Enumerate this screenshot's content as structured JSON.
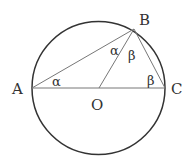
{
  "diagram": {
    "type": "geometry",
    "points": {
      "A": {
        "label": "A"
      },
      "B": {
        "label": "B"
      },
      "C": {
        "label": "C"
      },
      "O": {
        "label": "O"
      }
    },
    "angles": {
      "at_A": {
        "label": "α"
      },
      "at_B_left": {
        "label": "α"
      },
      "at_B_right": {
        "label": "β"
      },
      "at_C": {
        "label": "β"
      }
    },
    "colors": {
      "circle": "#333333",
      "lines": "#666666",
      "text": "#333333"
    }
  }
}
